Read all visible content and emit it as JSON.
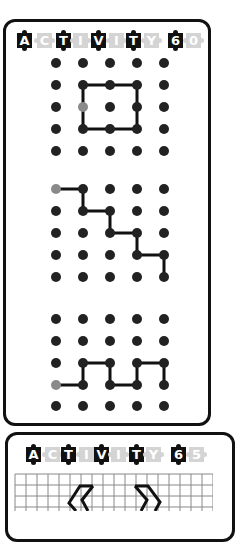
{
  "colors": {
    "ink": "#111111",
    "dot": "#222222",
    "start_dot": "#8a8a8a",
    "tile_dark": "#111111",
    "tile_light": "#d4d4d4",
    "grid_line": "#888888"
  },
  "card1": {
    "header_letters": [
      {
        "ch": "A",
        "style": "dark"
      },
      {
        "ch": "C",
        "style": "light"
      },
      {
        "ch": "T",
        "style": "dark"
      },
      {
        "ch": "I",
        "style": "light"
      },
      {
        "ch": "V",
        "style": "dark"
      },
      {
        "ch": "I",
        "style": "light"
      },
      {
        "ch": "T",
        "style": "dark"
      },
      {
        "ch": "Y",
        "style": "light"
      },
      {
        "ch": "6",
        "style": "dark"
      },
      {
        "ch": "0",
        "style": "light"
      }
    ],
    "title": "ACTIVITY 60",
    "dot_grids": [
      {
        "name": "square-puzzle",
        "rows": 5,
        "cols": 5,
        "start": [
          1,
          2
        ],
        "path": [
          [
            1,
            1
          ],
          [
            2,
            1
          ],
          [
            3,
            1
          ],
          [
            3,
            2
          ],
          [
            3,
            3
          ],
          [
            2,
            3
          ],
          [
            1,
            3
          ],
          [
            1,
            1
          ]
        ]
      },
      {
        "name": "staircase-puzzle",
        "rows": 5,
        "cols": 5,
        "start": [
          0,
          0
        ],
        "path": [
          [
            0,
            0
          ],
          [
            1,
            0
          ],
          [
            1,
            1
          ],
          [
            2,
            1
          ],
          [
            2,
            2
          ],
          [
            3,
            2
          ],
          [
            3,
            3
          ],
          [
            4,
            3
          ],
          [
            4,
            4
          ]
        ]
      },
      {
        "name": "wave-puzzle",
        "rows": 5,
        "cols": 5,
        "start": [
          0,
          3
        ],
        "path": [
          [
            0,
            3
          ],
          [
            1,
            3
          ],
          [
            1,
            2
          ],
          [
            2,
            2
          ],
          [
            2,
            3
          ],
          [
            3,
            3
          ],
          [
            3,
            2
          ],
          [
            4,
            2
          ],
          [
            4,
            3
          ]
        ]
      }
    ]
  },
  "card2": {
    "header_letters": [
      {
        "ch": "A",
        "style": "dark"
      },
      {
        "ch": "C",
        "style": "light"
      },
      {
        "ch": "T",
        "style": "dark"
      },
      {
        "ch": "I",
        "style": "light"
      },
      {
        "ch": "V",
        "style": "dark"
      },
      {
        "ch": "I",
        "style": "light"
      },
      {
        "ch": "T",
        "style": "dark"
      },
      {
        "ch": "Y",
        "style": "light"
      },
      {
        "ch": "6",
        "style": "dark"
      },
      {
        "ch": "5",
        "style": "light"
      }
    ],
    "title": "ACTIVITY 65",
    "grid_paper": {
      "cell_size": 11,
      "shapes": [
        "left-chevron",
        "right-chevron"
      ]
    }
  }
}
